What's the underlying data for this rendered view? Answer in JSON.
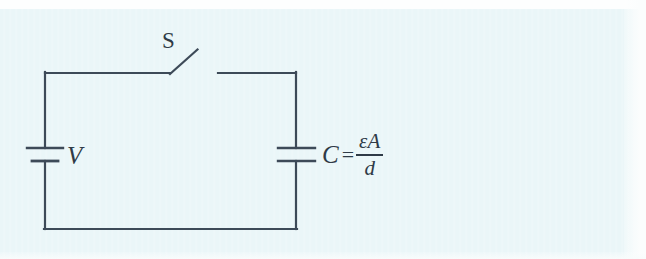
{
  "figure": {
    "kind": "circuit-diagram",
    "background_color": "#eaf6f8",
    "line_color": "#3d4a58",
    "text_color": "#2f3b47"
  },
  "labels": {
    "switch": "S",
    "battery": "V",
    "capacitor_symbol": "C",
    "equals": "=",
    "fraction_numerator": "εA",
    "fraction_denominator": "d"
  },
  "components": [
    {
      "id": "switch",
      "name": "switch",
      "label": "S",
      "state": "open",
      "hinge": [
        170,
        74
      ],
      "blade_tip": [
        197,
        50
      ],
      "contact": [
        218,
        73
      ]
    },
    {
      "id": "battery",
      "name": "battery",
      "label": "V",
      "position": [
        45,
        154
      ],
      "long_plate_y": 148,
      "short_plate_y": 161
    },
    {
      "id": "capacitor",
      "name": "capacitor",
      "label": "C = εA/d",
      "position": [
        296,
        154
      ],
      "top_plate_y": 148,
      "bottom_plate_y": 161
    }
  ],
  "wires": {
    "top_left": [
      [
        45,
        73
      ],
      [
        170,
        73
      ]
    ],
    "top_right": [
      [
        218,
        73
      ],
      [
        296,
        73
      ]
    ],
    "left_upper": [
      [
        45,
        73
      ],
      [
        45,
        148
      ]
    ],
    "left_lower": [
      [
        45,
        161
      ],
      [
        45,
        229
      ]
    ],
    "bottom": [
      [
        45,
        229
      ],
      [
        296,
        229
      ]
    ],
    "right_upper": [
      [
        296,
        73
      ],
      [
        296,
        148
      ]
    ],
    "right_lower": [
      [
        296,
        161
      ],
      [
        296,
        229
      ]
    ]
  }
}
